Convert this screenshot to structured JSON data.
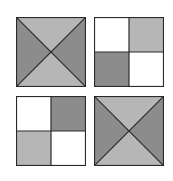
{
  "colors": {
    "dark": "#8c8c8c",
    "light": "#b6b6b6",
    "white": "#ffffff",
    "stroke": "#2a2a2a"
  },
  "tiles": [
    {
      "name": "tile-top-left",
      "type": "x-triangles",
      "top": "light",
      "right": "dark",
      "bottom": "light",
      "left": "dark"
    },
    {
      "name": "tile-top-right",
      "type": "quadrants",
      "tl": "white",
      "tr": "light",
      "bl": "dark",
      "br": "white"
    },
    {
      "name": "tile-bottom-left",
      "type": "quadrants",
      "tl": "white",
      "tr": "dark",
      "bl": "light",
      "br": "white"
    },
    {
      "name": "tile-bottom-right",
      "type": "x-triangles",
      "top": "light",
      "right": "dark",
      "bottom": "light",
      "left": "dark"
    }
  ]
}
